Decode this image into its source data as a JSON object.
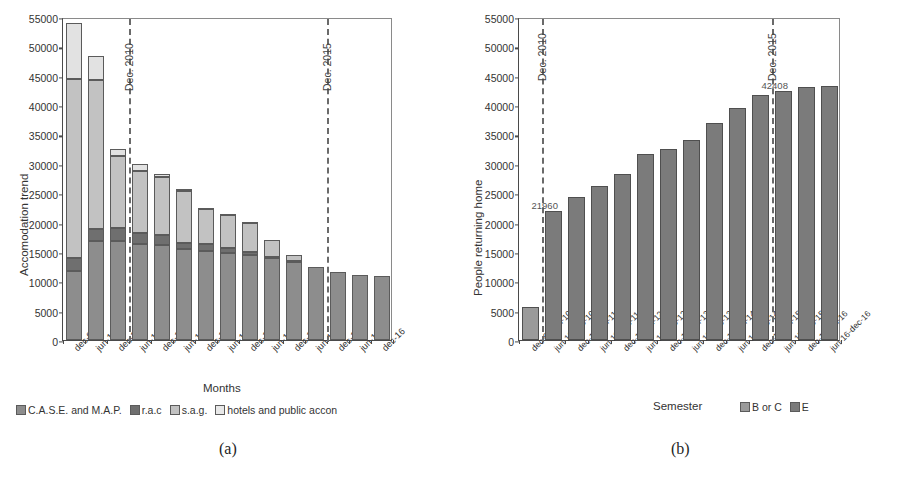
{
  "figure": {
    "caption_a": "(a)",
    "caption_b": "(b)"
  },
  "chart_data": [
    {
      "panel": "a",
      "type": "bar",
      "stacked": true,
      "title": "",
      "xlabel": "Months",
      "ylabel": "Accomodation trend",
      "ylim": [
        0,
        55000
      ],
      "yticks": [
        0,
        5000,
        10000,
        15000,
        20000,
        25000,
        30000,
        35000,
        40000,
        45000,
        50000,
        55000
      ],
      "ytick_labels": [
        "0",
        "5000",
        "10000",
        "15000",
        "20000",
        "25000",
        "30000",
        "35000",
        "40000",
        "45000",
        "50000",
        "55000"
      ],
      "grid": false,
      "legend_position": "bottom",
      "categories": [
        "dec-09",
        "jun-10",
        "dec-10",
        "jun-11",
        "dec-11",
        "jun-12",
        "dec-12",
        "jun-13",
        "dec-13",
        "jun-14",
        "dec-14",
        "jun-15",
        "dec-15",
        "jun-16",
        "dec-16"
      ],
      "series": [
        {
          "name": "C.A.S.E. and M.A.P.",
          "values": [
            11700,
            16800,
            16800,
            16300,
            16100,
            15500,
            15200,
            14800,
            14400,
            13900,
            13300,
            12400,
            11600,
            11100,
            10950
          ]
        },
        {
          "name": "r.a.c",
          "values": [
            2300,
            2100,
            2200,
            2000,
            1700,
            1000,
            1100,
            900,
            600,
            150,
            150,
            0,
            0,
            0,
            0
          ]
        },
        {
          "name": "s.a.g.",
          "values": [
            30500,
            25400,
            12300,
            10400,
            10000,
            8900,
            6000,
            5600,
            5000,
            3000,
            1100,
            0,
            0,
            0,
            0
          ]
        },
        {
          "name": "hotels and public accon",
          "values": [
            9500,
            4100,
            1200,
            1200,
            500,
            250,
            250,
            150,
            100,
            0,
            0,
            0,
            0,
            0,
            0
          ]
        }
      ],
      "totals": [
        54000,
        48400,
        32500,
        29900,
        28300,
        25650,
        22550,
        21450,
        20100,
        17050,
        14550,
        12400,
        11600,
        11100,
        10950
      ],
      "reference_lines": [
        {
          "label": "Dec. 2010",
          "after_category": "dec-10"
        },
        {
          "label": "Dec. 2015",
          "after_category": "jun-15"
        }
      ]
    },
    {
      "panel": "b",
      "type": "bar",
      "stacked": false,
      "title": "",
      "xlabel": "Semester",
      "ylabel": "People returning home",
      "ylim": [
        0,
        55000
      ],
      "yticks": [
        0,
        5000,
        10000,
        15000,
        20000,
        25000,
        30000,
        35000,
        40000,
        45000,
        50000,
        55000
      ],
      "ytick_labels": [
        "0",
        "5000",
        "10000",
        "15000",
        "20000",
        "25000",
        "30000",
        "35000",
        "40000",
        "45000",
        "50000",
        "55000"
      ],
      "grid": false,
      "legend_position": "bottom-right",
      "categories": [
        "dec-09-jun-10",
        "jun-10-dec-10",
        "dec-10-jun-11",
        "jun-11-dec-11",
        "dec-11-jun-12",
        "jun-12-dec-12",
        "dec-12-jun-13",
        "jun-13-dec-13",
        "dec-13-jun-14",
        "jun-14-dec-14",
        "dec-14-jun-15",
        "jun-15-dec-15",
        "dec-15-jun-16",
        "jun-16-dec-16"
      ],
      "values": [
        5600,
        21960,
        24300,
        26200,
        28300,
        31600,
        32600,
        34100,
        37000,
        39500,
        41700,
        42408,
        43000,
        43300
      ],
      "series_key": [
        "B or C",
        "E",
        "E",
        "E",
        "E",
        "E",
        "E",
        "E",
        "E",
        "E",
        "E",
        "E",
        "E",
        "E"
      ],
      "legend_entries": [
        "B or C",
        "E"
      ],
      "annotations": [
        {
          "text": "21960",
          "category": "jun-10-dec-10",
          "value": 21960
        },
        {
          "text": "42408",
          "category": "jun-15-dec-15",
          "value": 42408
        }
      ],
      "reference_lines": [
        {
          "label": "Dec. 2010",
          "before_category": "jun-10-dec-10"
        },
        {
          "label": "Dec. 2015",
          "before_category": "jun-15-dec-15"
        }
      ]
    }
  ],
  "colors": {
    "series_case_map": "#8d8d8d",
    "series_rac": "#6f6f6f",
    "series_sag": "#c2c2c2",
    "series_hotels": "#e8e8e8",
    "series_borc": "#9a9a9a",
    "series_e": "#7b7b7b",
    "axis": "#4a4a4a",
    "refline": "#6a6a6a"
  }
}
